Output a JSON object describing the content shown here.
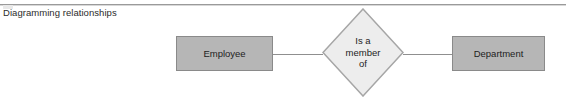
{
  "figure": {
    "caption": "Diagramming relationships",
    "background_color": "#ffffff",
    "rule_color": "#9a9a9a"
  },
  "diagram": {
    "type": "entity-relationship",
    "entities": [
      {
        "label": "Employee",
        "fill_color": "#b6b6b6",
        "border_color": "#8a8a8a"
      },
      {
        "label": "Department",
        "fill_color": "#b6b6b6",
        "border_color": "#8a8a8a"
      }
    ],
    "relationship": {
      "lines": [
        "Is a",
        "member",
        "of"
      ],
      "fill_color": "#ededed",
      "border_color": "#a6a6a6"
    },
    "connectors": [
      {
        "from": "Employee",
        "to": "Is a member of",
        "color": "#8f8f8f"
      },
      {
        "from": "Is a member of",
        "to": "Department",
        "color": "#8f8f8f"
      }
    ]
  }
}
